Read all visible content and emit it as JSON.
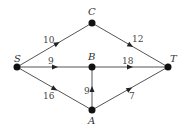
{
  "diagram": {
    "type": "directed-network",
    "nodes": [
      {
        "id": "S",
        "label": "S",
        "x": 17,
        "y": 67
      },
      {
        "id": "C",
        "label": "C",
        "x": 92,
        "y": 23
      },
      {
        "id": "B",
        "label": "B",
        "x": 92,
        "y": 67
      },
      {
        "id": "A",
        "label": "A",
        "x": 92,
        "y": 110
      },
      {
        "id": "T",
        "label": "T",
        "x": 168,
        "y": 67
      }
    ],
    "edges": [
      {
        "from": "S",
        "to": "C",
        "weight": "10"
      },
      {
        "from": "S",
        "to": "B",
        "weight": "9"
      },
      {
        "from": "S",
        "to": "A",
        "weight": "16"
      },
      {
        "from": "C",
        "to": "T",
        "weight": "12"
      },
      {
        "from": "B",
        "to": "T",
        "weight": "18"
      },
      {
        "from": "A",
        "to": "B",
        "weight": "9"
      },
      {
        "from": "A",
        "to": "T",
        "weight": "7"
      }
    ]
  }
}
